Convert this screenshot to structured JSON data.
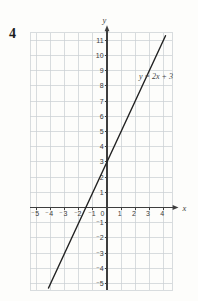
{
  "page": {
    "problem_number": "4",
    "background": "#fdfdfb"
  },
  "chart_data": {
    "type": "line",
    "title": "",
    "xlabel": "x",
    "ylabel": "y",
    "xlim": [
      -5.45,
      4.62
    ],
    "ylim": [
      -5.45,
      11.5
    ],
    "grid": true,
    "x_ticks": [
      -5,
      -4,
      -3,
      -2,
      -1,
      0,
      1,
      2,
      3,
      4
    ],
    "x_tick_labels": [
      "⁻5",
      "⁻4",
      "⁻3",
      "⁻2",
      "⁻1",
      "0",
      "1",
      "2",
      "3",
      "4"
    ],
    "y_ticks": [
      -5,
      -4,
      -3,
      -2,
      -1,
      1,
      2,
      3,
      4,
      5,
      6,
      7,
      8,
      9,
      10,
      11
    ],
    "y_tick_labels": [
      "⁻5",
      "⁻4",
      "⁻3",
      "⁻2",
      "⁻1",
      "1",
      "2",
      "3",
      "4",
      "5",
      "6",
      "7",
      "8",
      "9",
      "10",
      "11"
    ],
    "series": [
      {
        "name": "y = 2x + 3",
        "slope": 2,
        "intercept": 3,
        "x_range": [
          -4.15,
          4.15
        ],
        "points": [
          [
            -4,
            -5
          ],
          [
            -1.5,
            0
          ],
          [
            0,
            3
          ],
          [
            4,
            11
          ]
        ]
      }
    ],
    "annotations": [
      {
        "text": "y = 2x + 3"
      }
    ],
    "colors": {
      "grid": "#cbd0d4",
      "axis": "#3e3e3e",
      "line": "#222222",
      "tick_text": "#3a3a3a",
      "annotation_text": "#444444"
    }
  }
}
